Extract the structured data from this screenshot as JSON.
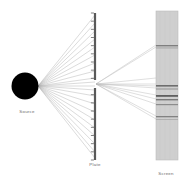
{
  "figure": {
    "background_color": "#ffffff",
    "width": 189,
    "height": 186
  },
  "labels": {
    "source": "Source",
    "plate": "Plate",
    "screen": "Screen",
    "color": "#6b6b6b"
  },
  "source": {
    "name": "Source",
    "shape": "circle",
    "center_x": 25,
    "center_y": 86,
    "radius": 13.5,
    "color": "#000000"
  },
  "plate": {
    "name": "Plate",
    "x": 95,
    "top": 13,
    "bottom": 160,
    "thickness": 2.2,
    "color": "#595959",
    "slit": {
      "center_y": 84,
      "gap": 8
    },
    "tick_count": 18,
    "tick_length": 3,
    "tick_color": "#4a4a4a"
  },
  "screen": {
    "name": "Screen",
    "x": 156,
    "y": 11,
    "width": 22,
    "height": 149,
    "fill_color": "#cfcfcf",
    "border_color": "#bcbcbc",
    "fringes": [
      {
        "y": 45,
        "height": 1.4,
        "color": "#7f7f7f"
      },
      {
        "y": 47.5,
        "height": 0.9,
        "color": "#a0a0a0"
      },
      {
        "y": 85,
        "height": 1.6,
        "color": "#6e6e6e"
      },
      {
        "y": 88.5,
        "height": 1.0,
        "color": "#949494"
      },
      {
        "y": 95,
        "height": 1.8,
        "color": "#5f5f5f"
      },
      {
        "y": 99,
        "height": 1.4,
        "color": "#7a7a7a"
      },
      {
        "y": 104,
        "height": 1.2,
        "color": "#8c8c8c"
      },
      {
        "y": 116,
        "height": 1.3,
        "color": "#828282"
      },
      {
        "y": 119,
        "height": 0.8,
        "color": "#a8a8a8"
      }
    ],
    "texture_lines": [
      {
        "x": 160,
        "color": "#c4c4c4"
      },
      {
        "x": 165,
        "color": "#c7c7c7"
      },
      {
        "x": 170,
        "color": "#c4c4c4"
      },
      {
        "x": 175,
        "color": "#c8c8c8"
      }
    ]
  },
  "rays_incident": {
    "description": "Rays from the source to the plate",
    "origin_x": 38,
    "origin_y": 86,
    "end_x": 95,
    "color": "#aeaeae",
    "stroke_width": 0.45,
    "end_y_values": [
      15,
      23,
      31,
      39,
      47,
      55,
      63,
      71,
      78,
      82,
      86,
      90,
      96,
      104,
      112,
      120,
      128,
      136,
      144,
      152,
      158
    ]
  },
  "rays_diffracted": {
    "description": "Rays from the slit to the screen",
    "origin_x": 96,
    "origin_y": 84,
    "end_x": 156,
    "color": "#b8b8b8",
    "stroke_width": 0.45,
    "end_y_values": [
      45,
      47,
      78,
      84,
      86,
      88,
      95,
      99,
      104,
      116,
      119
    ]
  }
}
